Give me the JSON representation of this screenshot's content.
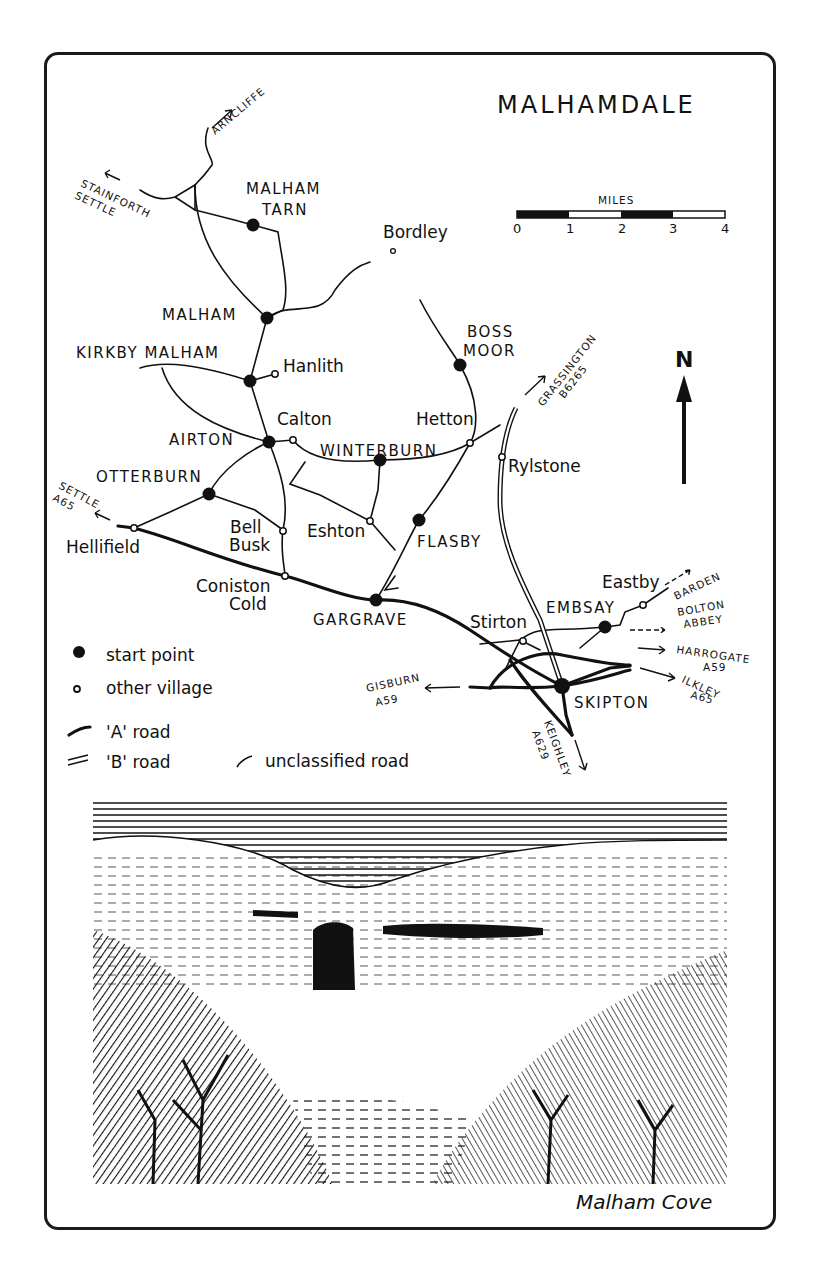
{
  "map": {
    "title": "MALHAMDALE",
    "scale": {
      "label": "MILES",
      "ticks": [
        "0",
        "1",
        "2",
        "3",
        "4"
      ]
    },
    "north_label": "N",
    "start_points": [
      {
        "name": "MALHAM TARN",
        "line1": "MALHAM",
        "line2": "TARN"
      },
      {
        "name": "MALHAM"
      },
      {
        "name": "KIRKBY MALHAM"
      },
      {
        "name": "AIRTON"
      },
      {
        "name": "OTTERBURN"
      },
      {
        "name": "WINTERBURN"
      },
      {
        "name": "BOSS MOOR",
        "line1": "BOSS",
        "line2": "MOOR"
      },
      {
        "name": "FLASBY"
      },
      {
        "name": "GARGRAVE"
      },
      {
        "name": "EMBSAY"
      },
      {
        "name": "SKIPTON"
      }
    ],
    "villages": [
      {
        "name": "Bordley"
      },
      {
        "name": "Hanlith"
      },
      {
        "name": "Calton"
      },
      {
        "name": "Hetton"
      },
      {
        "name": "Rylstone"
      },
      {
        "name": "Hellifield"
      },
      {
        "name": "Bell Busk",
        "line1": "Bell",
        "line2": "Busk"
      },
      {
        "name": "Eshton"
      },
      {
        "name": "Coniston Cold",
        "line1": "Coniston",
        "line2": "Cold"
      },
      {
        "name": "Stirton"
      },
      {
        "name": "Eastby"
      }
    ],
    "directions": [
      {
        "name": "ARNCLIFFE"
      },
      {
        "name": "STAINFORTH SETTLE",
        "line1": "STAINFORTH",
        "line2": "SETTLE"
      },
      {
        "name": "GRASSINGTON B6265",
        "line1": "GRASSINGTON",
        "line2": "B6265"
      },
      {
        "name": "SETTLE A65",
        "line1": "SETTLE",
        "line2": "A65"
      },
      {
        "name": "BARDEN"
      },
      {
        "name": "BOLTON ABBEY",
        "line1": "BOLTON",
        "line2": "ABBEY"
      },
      {
        "name": "HARROGATE A59",
        "line1": "HARROGATE",
        "line2": "A59"
      },
      {
        "name": "ILKLEY A65",
        "line1": "ILKLEY",
        "line2": "A65"
      },
      {
        "name": "GISBURN A59",
        "line1": "GISBURN",
        "line2": "A59"
      },
      {
        "name": "KEIGHLEY A629",
        "line1": "KEIGHLEY",
        "line2": "A629"
      }
    ],
    "legend": [
      {
        "symbol": "filled-dot",
        "label": "start point"
      },
      {
        "symbol": "open-circle",
        "label": "other village"
      },
      {
        "symbol": "thick-line",
        "label": "'A' road"
      },
      {
        "symbol": "double-line",
        "label": "'B' road"
      },
      {
        "symbol": "thin-line",
        "label": "unclassified road"
      }
    ]
  },
  "illustration": {
    "caption": "Malham Cove"
  }
}
